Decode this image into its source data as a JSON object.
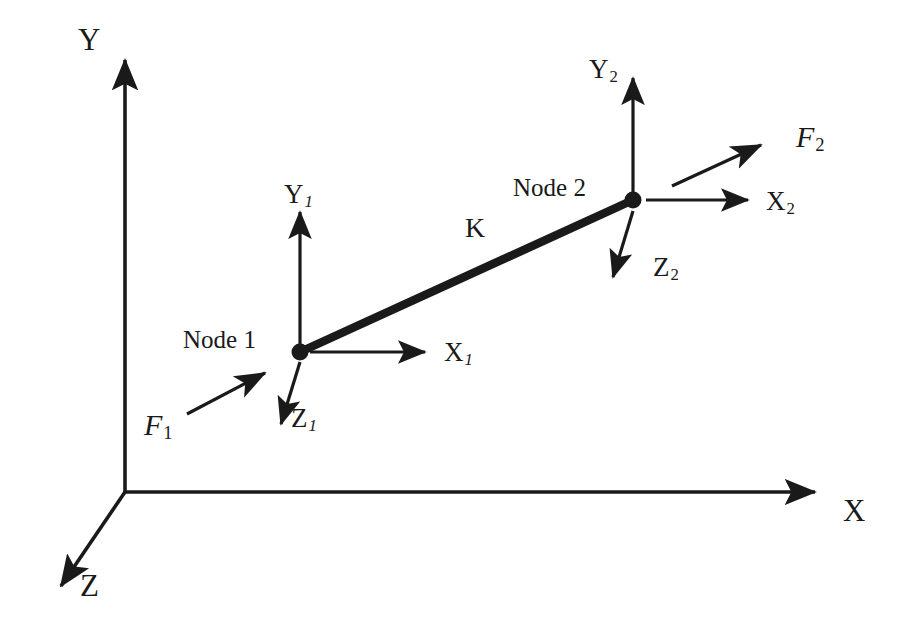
{
  "diagram": {
    "stroke_color": "#1a1a1a",
    "background_color": "#ffffff",
    "global_axes": [
      {
        "id": "global-y",
        "label": "Y",
        "direction": "up"
      },
      {
        "id": "global-x",
        "label": "X",
        "direction": "right"
      },
      {
        "id": "global-z",
        "label": "Z",
        "direction": "down-left"
      }
    ],
    "global_labels": {
      "y": "Y",
      "x": "X",
      "z": "Z"
    },
    "element": {
      "stiffness_label": "K",
      "node1_label": "Node 1",
      "node2_label": "Node 2"
    },
    "node1_axes": {
      "x": "X",
      "x_sub": "1",
      "y": "Y",
      "y_sub": "1",
      "z": "Z",
      "z_sub": "1"
    },
    "node2_axes": {
      "x": "X",
      "x_sub": "2",
      "y": "Y",
      "y_sub": "2",
      "z": "Z",
      "z_sub": "2"
    },
    "forces": [
      {
        "id": "force-1",
        "symbol": "F",
        "subscript": "1",
        "at_node": "Node 1"
      },
      {
        "id": "force-2",
        "symbol": "F",
        "subscript": "2",
        "at_node": "Node 2"
      }
    ],
    "force_labels": {
      "f1_symbol": "F",
      "f1_sub": "1",
      "f2_symbol": "F",
      "f2_sub": "2"
    }
  }
}
